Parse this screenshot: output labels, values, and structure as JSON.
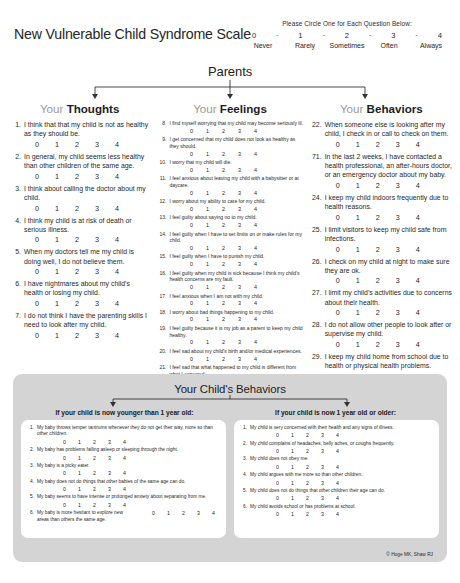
{
  "header": {
    "title": "New Vulnerable Child Syndrome Scale",
    "legend_caption": "Please Circle One for Each Question Below:",
    "legend_numbers": [
      "0",
      "1",
      "2",
      "3",
      "4"
    ],
    "legend_labels": [
      "Never",
      "Rarely",
      "Sometimes",
      "Often",
      "Always"
    ],
    "dash": "-",
    "section_title": "Parents"
  },
  "scale_options": [
    "0",
    "1",
    "2",
    "3",
    "4"
  ],
  "columns": [
    {
      "head_prefix": "Your",
      "head_word": "Thoughts",
      "items": [
        {
          "num": "1.",
          "text": "I think that that my child is not as healthy as they should be."
        },
        {
          "num": "2.",
          "text": "In general, my child seems less healthy than other children of the same age."
        },
        {
          "num": "3.",
          "text": "I think about calling the doctor about my child."
        },
        {
          "num": "4.",
          "text": "I think my child is at risk of death or serious illness."
        },
        {
          "num": "5.",
          "text": "When my doctors tell me my child is doing well, I do not believe them."
        },
        {
          "num": "6.",
          "text": "I have nightmares about my child's health or losing my child."
        },
        {
          "num": "7.",
          "text": "I do not think I have the parenting skills I need to look after my child."
        }
      ]
    },
    {
      "head_prefix": "Your",
      "head_word": "Feelings",
      "items": [
        {
          "num": "8.",
          "text": "I find myself worrying that my child may become seriously ill."
        },
        {
          "num": "9.",
          "text": "I get concerned that my child does not look as healthy as they should."
        },
        {
          "num": "10.",
          "text": "I worry that my child will die."
        },
        {
          "num": "11.",
          "text": "I feel anxious about leaving my child with a babysitter or at daycare."
        },
        {
          "num": "12.",
          "text": "I worry about my ability to care for my child."
        },
        {
          "num": "13.",
          "text": "I feel guilty about saying no to my child."
        },
        {
          "num": "14.",
          "text": "I feel guilty when I have to set limits on or make rules for my child."
        },
        {
          "num": "15.",
          "text": "I feel guilty when I have to punish my child."
        },
        {
          "num": "16.",
          "text": "I feel guilty when my child is sick because I think my child's health concerns are my fault."
        },
        {
          "num": "17.",
          "text": "I feel anxious when I am not with my child."
        },
        {
          "num": "18.",
          "text": "I worry about bad things happening to my child."
        },
        {
          "num": "19.",
          "text": "I feel guilty because it is my job as a parent to keep my child healthy."
        },
        {
          "num": "20.",
          "text": "I feel sad about my child's birth and/or medical experiences."
        },
        {
          "num": "21.",
          "text": "I feel sad that what happened to my child is different from what I expected."
        }
      ]
    },
    {
      "head_prefix": "Your",
      "head_word": "Behaviors",
      "items": [
        {
          "num": "22.",
          "text": "When someone else is looking after my child, I check in or call to check on them."
        },
        {
          "num": "71.",
          "text": "In the last 2 weeks, I have contacted a health professional, an after-hours doctor, or an emergency doctor about my baby."
        },
        {
          "num": "24.",
          "text": "I keep my child indoors frequently due to health reasons."
        },
        {
          "num": "25.",
          "text": "I limit visitors to keep my child safe from infections."
        },
        {
          "num": "26.",
          "text": "I check on my child at night to make sure they are ok."
        },
        {
          "num": "27.",
          "text": "I limit my child's activities due to concerns about their health."
        },
        {
          "num": "28.",
          "text": "I do not allow other people to look after or supervise my child."
        },
        {
          "num": "29.",
          "text": "I keep my child home from school due to health or physical health problems."
        }
      ]
    }
  ],
  "panel": {
    "title": "Your Child's Behaviors",
    "left": {
      "heading": "If your child is now younger than 1 year old:",
      "items": [
        {
          "num": "1.",
          "text": "My baby throws temper tantrums whenever they do not get their way, more so than other children.",
          "inline": false
        },
        {
          "num": "2.",
          "text": "My baby has problems falling asleep or sleeping through the night.",
          "inline": false
        },
        {
          "num": "3.",
          "text": "My baby is a picky eater.",
          "inline": false
        },
        {
          "num": "4.",
          "text": "My baby does not do things that other babies of the same age can do.",
          "inline": false
        },
        {
          "num": "5.",
          "text": "My baby seems to have intense or prolonged anxiety about separating from me.",
          "inline": false
        },
        {
          "num": "6.",
          "text": "My baby is more hesitant to explore new areas than others the same age.",
          "inline": true
        }
      ]
    },
    "right": {
      "heading": "If your child is now 1 year old or older:",
      "items": [
        {
          "num": "1.",
          "text": "My child is very concerned with their health and any signs of illness.",
          "inline": false
        },
        {
          "num": "2.",
          "text": "My child complains of headaches, belly aches, or coughs frequently.",
          "inline": false
        },
        {
          "num": "3.",
          "text": "My child does not obey me.",
          "inline": false
        },
        {
          "num": "4.",
          "text": "My child argues with me more so than other children.",
          "inline": false
        },
        {
          "num": "5.",
          "text": "My child does not do things that other children their age can do.",
          "inline": false
        },
        {
          "num": "6.",
          "text": "My child avoids school or has problems at school.",
          "inline": false
        }
      ]
    }
  },
  "copyright": "© Hoge MK, Shaw RJ"
}
